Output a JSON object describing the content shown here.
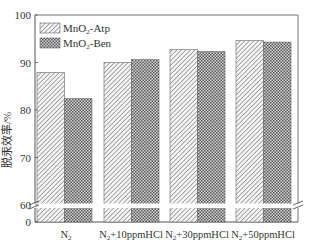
{
  "chart_data": {
    "type": "bar",
    "title": "",
    "xlabel": "",
    "ylabel": "脱汞效率/%",
    "ylim": [
      0,
      100
    ],
    "axis_break": {
      "from": 0,
      "to": 60
    },
    "yticks": [
      0,
      60,
      70,
      80,
      90,
      100
    ],
    "categories": [
      "N2",
      "N2+10ppmHCl",
      "N2+30ppmHCl",
      "N2+50ppmHCl"
    ],
    "category_labels": [
      {
        "pre": "N",
        "sub": "2",
        "post": ""
      },
      {
        "pre": "N",
        "sub": "2",
        "post": "+10ppmHCl"
      },
      {
        "pre": "N",
        "sub": "2",
        "post": "+30ppmHCl"
      },
      {
        "pre": "N",
        "sub": "2",
        "post": "+50ppmHCl"
      }
    ],
    "series": [
      {
        "name": "MnO2-Atp",
        "label_pre": "MnO",
        "label_sub": "2",
        "label_post": "-Atp",
        "pattern": "diagonal-hatch",
        "values": [
          87.9,
          90.0,
          92.7,
          94.6
        ]
      },
      {
        "name": "MnO2-Ben",
        "label_pre": "MnO",
        "label_sub": "2",
        "label_post": "-Ben",
        "pattern": "crosshatch-dots",
        "values": [
          82.4,
          90.6,
          92.3,
          94.3
        ]
      }
    ],
    "legend_position": "upper-left",
    "grid": false
  }
}
